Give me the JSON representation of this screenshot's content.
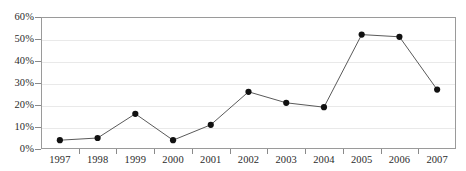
{
  "chart_data": {
    "type": "line",
    "title": "",
    "subtitle": "",
    "xlabel": "",
    "ylabel": "",
    "categories": [
      "1997",
      "1998",
      "1999",
      "2000",
      "2001",
      "2002",
      "2003",
      "2004",
      "2005",
      "2006",
      "2007"
    ],
    "series": [
      {
        "name": "",
        "values": [
          4,
          5,
          16,
          4,
          11,
          26,
          21,
          19,
          52,
          51,
          27
        ]
      }
    ],
    "ylim": [
      0,
      60
    ],
    "ytick_values": [
      0,
      10,
      20,
      30,
      40,
      50,
      60
    ],
    "ytick_labels": [
      "0%",
      "10%",
      "20%",
      "30%",
      "40%",
      "50%",
      "60%"
    ],
    "ytick_step": 10,
    "grid": true,
    "grid_axis": "y",
    "legend": false,
    "legend_position": "none",
    "marker": "filled-circle",
    "marker_color": "#111111",
    "line_color": "#5a5a5a",
    "grid_color": "#e9e9e9",
    "frame_color": "#9a9a9a",
    "background": "#ffffff",
    "annotations": []
  },
  "axes": {
    "y_axis_name": "percent-axis",
    "x_axis_name": "year-axis"
  }
}
